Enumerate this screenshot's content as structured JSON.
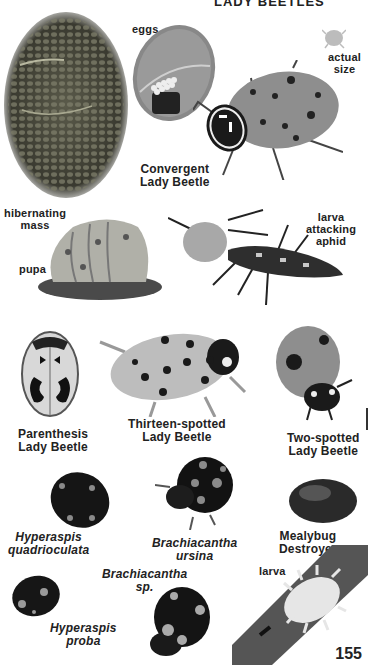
{
  "page": {
    "section_title": "LADY BEETLES",
    "page_number": "155"
  },
  "labels": {
    "eggs": "eggs",
    "actual_size_1": "actual",
    "actual_size_2": "size",
    "convergent_1": "Convergent",
    "convergent_2": "Lady Beetle",
    "hibernating_1": "hibernating",
    "hibernating_2": "mass",
    "pupa": "pupa",
    "larva_attacking_1": "larva",
    "larva_attacking_2": "attacking",
    "larva_attacking_3": "aphid",
    "parenthesis_1": "Parenthesis",
    "parenthesis_2": "Lady Beetle",
    "thirteen_1": "Thirteen-spotted",
    "thirteen_2": "Lady Beetle",
    "twospotted_1": "Two-spotted",
    "twospotted_2": "Lady Beetle",
    "hyper_quad_1": "Hyperaspis",
    "hyper_quad_2": "quadrioculata",
    "brach_ursina_1": "Brachiacantha",
    "brach_ursina_2": "ursina",
    "mealybug_1": "Mealybug",
    "mealybug_2": "Destroyer",
    "brach_sp_1": "Brachiacantha",
    "brach_sp_2": "sp.",
    "hyper_proba_1": "Hyperaspis",
    "hyper_proba_2": "proba",
    "larva": "larva"
  }
}
